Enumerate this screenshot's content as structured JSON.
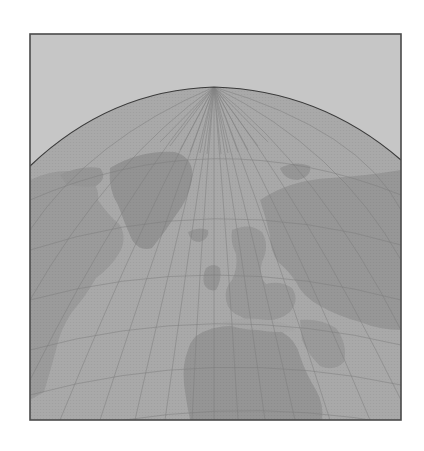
{
  "map": {
    "projection": "perspective-globe",
    "view": "northern-hemisphere-atlantic",
    "frame": {
      "x": 30,
      "y": 34,
      "width": 371,
      "height": 386
    },
    "horizon_peak": {
      "x": 214,
      "y": 87
    },
    "pole": {
      "x": 214,
      "y": 87
    },
    "colors": {
      "sky": "#c6c6c6",
      "ocean": "#a9a9a9",
      "land": "#9a9a9a",
      "land_dark": "#929292",
      "graticule": "#7d7d7d",
      "horizon": "#3a3a3a",
      "frame": "#4a4a4a",
      "page": "#ffffff"
    },
    "regions": [
      {
        "name": "greenland"
      },
      {
        "name": "north-america"
      },
      {
        "name": "europe"
      },
      {
        "name": "asia"
      },
      {
        "name": "africa"
      },
      {
        "name": "iceland"
      },
      {
        "name": "british-isles"
      }
    ]
  }
}
